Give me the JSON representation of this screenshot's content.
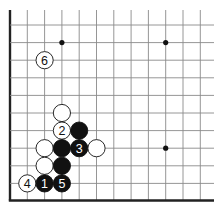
{
  "diagram": {
    "type": "go-board-fragment",
    "grid": {
      "origin_x": 10,
      "origin_y": 25,
      "spacing_x": 17.3,
      "spacing_y": 17.6,
      "cols": 12,
      "rows": 10,
      "left_edge": true,
      "bottom_edge": true,
      "line_color": "#8a8a8a",
      "edge_color": "#222222"
    },
    "star_points": [
      {
        "col": 3,
        "row": 1
      },
      {
        "col": 9,
        "row": 1
      },
      {
        "col": 9,
        "row": 7
      }
    ],
    "stones": [
      {
        "color": "white",
        "col": 2,
        "row": 2,
        "label": "6"
      },
      {
        "color": "white",
        "col": 3,
        "row": 5,
        "label": ""
      },
      {
        "color": "white",
        "col": 3,
        "row": 6,
        "label": "2"
      },
      {
        "color": "black",
        "col": 4,
        "row": 6,
        "label": ""
      },
      {
        "color": "white",
        "col": 2,
        "row": 7,
        "label": ""
      },
      {
        "color": "black",
        "col": 3,
        "row": 7,
        "label": ""
      },
      {
        "color": "black",
        "col": 4,
        "row": 7,
        "label": "3"
      },
      {
        "color": "white",
        "col": 5,
        "row": 7,
        "label": ""
      },
      {
        "color": "white",
        "col": 2,
        "row": 8,
        "label": ""
      },
      {
        "color": "black",
        "col": 3,
        "row": 8,
        "label": ""
      },
      {
        "color": "white",
        "col": 1,
        "row": 9,
        "label": "4"
      },
      {
        "color": "black",
        "col": 2,
        "row": 9,
        "label": "1"
      },
      {
        "color": "black",
        "col": 3,
        "row": 9,
        "label": "5"
      }
    ]
  }
}
